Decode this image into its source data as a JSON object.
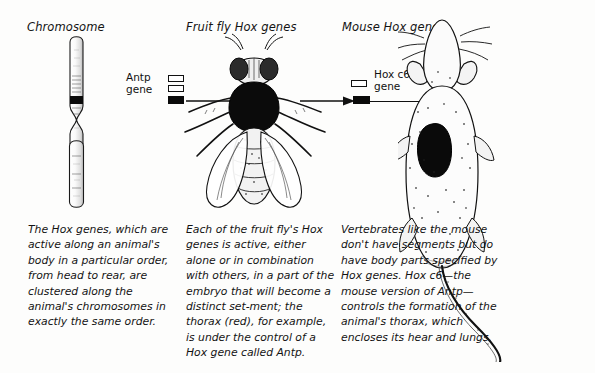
{
  "figure": {
    "type": "scientific-illustration",
    "topic": "Hox genes across species",
    "background_color": "#fdfdfc",
    "ink_color": "#111111"
  },
  "panels": {
    "chromosome": {
      "title": "Chromosome",
      "caption": "The Hox genes, which are active along an animal's body in a particular order, from head to rear, are clustered along the animal's chromosomes in exactly the same order.",
      "artwork": "chromosome-illustration"
    },
    "fruit_fly": {
      "title": "Fruit fly Hox genes",
      "caption": "Each of the fruit fly's Hox genes is active, either alone or in combination with others, in a part of the embryo that will become a distinct set-ment; the thorax (red), for example, is under the control of a Hox gene called Antp.",
      "artwork": "fruit-fly-illustration",
      "gene_label": "Antp\ngene",
      "gene_boxes": [
        {
          "state": "outline"
        },
        {
          "state": "outline"
        },
        {
          "state": "filled"
        }
      ]
    },
    "mouse": {
      "title": "Mouse Hox genes",
      "caption": "Vertebrates like the mouse don't have segments but do have body parts specified by Hox genes. Hox c6—the mouse version of Antp—controls the formation of the animal's thorax, which encloses its hear and lungs.",
      "artwork": "mouse-illustration",
      "gene_label": "Hox c6\ngene",
      "gene_boxes": [
        {
          "state": "outline"
        },
        {
          "state": "filled"
        }
      ]
    }
  },
  "annotations": {
    "arrow_to_fly_thorax": "arrow pointing to fruit fly thorax",
    "arrow_to_hoxc6": "arrow pointing to Hox c6 gene box",
    "line_to_mouse_thorax": "leader line to mouse thorax"
  }
}
